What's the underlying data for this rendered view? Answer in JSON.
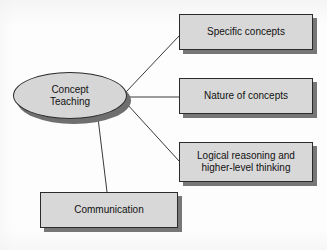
{
  "diagram": {
    "title": "Concept Teaching",
    "center_node": {
      "id": "concept-teaching",
      "label": "Concept\nTeaching",
      "shape": "ellipse",
      "fill": "#d6d6d6",
      "stroke": "#2b2b2b",
      "shadow": "#6f6f6f"
    },
    "nodes": [
      {
        "id": "specific-concepts",
        "label": "Specific concepts",
        "shape": "rectangle",
        "fill": "#d8d8d8",
        "stroke": "#2b2b2b",
        "shadow": "#777777"
      },
      {
        "id": "nature-of-concepts",
        "label": "Nature of concepts",
        "shape": "rectangle",
        "fill": "#d8d8d8",
        "stroke": "#2b2b2b",
        "shadow": "#777777"
      },
      {
        "id": "logical-reasoning",
        "label": "Logical reasoning and\nhigher-level thinking",
        "shape": "rectangle",
        "fill": "#d8d8d8",
        "stroke": "#2b2b2b",
        "shadow": "#777777"
      },
      {
        "id": "communication",
        "label": "Communication",
        "shape": "rectangle",
        "fill": "#d8d8d8",
        "stroke": "#2b2b2b",
        "shadow": "#777777"
      }
    ],
    "edges": [
      {
        "from": "concept-teaching",
        "to": "specific-concepts",
        "style": "straight-line"
      },
      {
        "from": "concept-teaching",
        "to": "nature-of-concepts",
        "style": "straight-line"
      },
      {
        "from": "concept-teaching",
        "to": "logical-reasoning",
        "style": "straight-line"
      },
      {
        "from": "concept-teaching",
        "to": "communication",
        "style": "straight-line"
      }
    ],
    "background": "#fdfdfd",
    "line_color": "#3a3a3a"
  }
}
